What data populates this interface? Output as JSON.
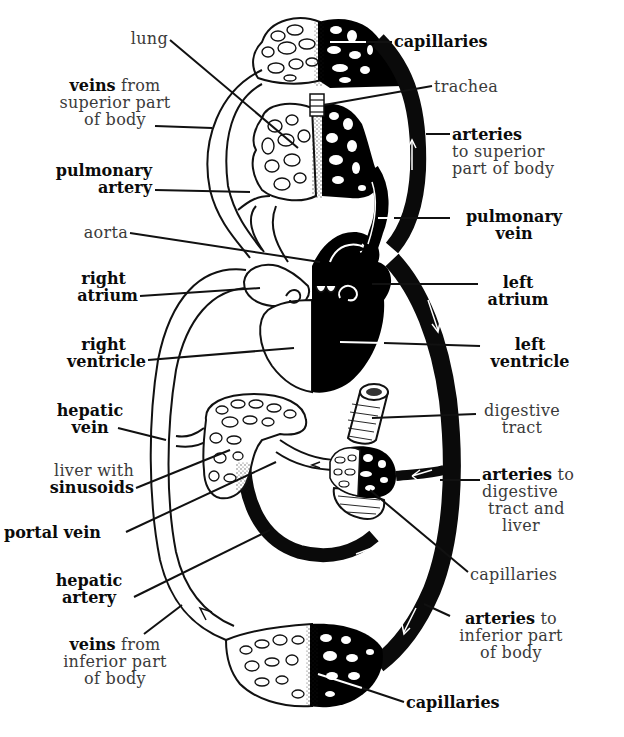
{
  "diagram": {
    "labels": {
      "lung": {
        "line1": "lung"
      },
      "capillaries_top": {
        "line1": "capillaries"
      },
      "trachea": {
        "line1": "trachea"
      },
      "veins_superior": {
        "bold": "veins",
        "rest": " from",
        "line2": "superior part",
        "line3": "of body"
      },
      "arteries_superior": {
        "bold": "arteries",
        "line2": "to superior",
        "line3": "part of body"
      },
      "pulmonary_artery": {
        "line1": "pulmonary",
        "line2": "artery"
      },
      "pulmonary_vein": {
        "line1": "pulmonary",
        "line2": "vein"
      },
      "aorta": {
        "line1": "aorta"
      },
      "right_atrium": {
        "line1": "right",
        "line2": "atrium"
      },
      "left_atrium": {
        "line1": "left",
        "line2": "atrium"
      },
      "right_ventricle": {
        "line1": "right",
        "line2": "ventricle"
      },
      "left_ventricle": {
        "line1": "left",
        "line2": "ventricle"
      },
      "hepatic_vein": {
        "line1": "hepatic",
        "line2": "vein"
      },
      "digestive_tract": {
        "line1": "digestive",
        "line2": "tract"
      },
      "liver": {
        "line1": "liver with",
        "line2": "sinusoids"
      },
      "arteries_digestive": {
        "bold": "arteries",
        "rest": " to",
        "line2": "digestive",
        "line3": "tract and",
        "line4": "liver"
      },
      "portal_vein": {
        "line1": "portal vein"
      },
      "capillaries_mid": {
        "line1": "capillaries"
      },
      "hepatic_artery": {
        "line1": "hepatic",
        "line2": "artery"
      },
      "arteries_inferior": {
        "bold": "arteries",
        "rest": " to",
        "line2": "inferior part",
        "line3": "of body"
      },
      "veins_inferior": {
        "bold": "veins",
        "rest": " from",
        "line2": "inferior part",
        "line3": "of body"
      },
      "capillaries_bottom": {
        "line1": "capillaries"
      }
    },
    "colors": {
      "oxygenated": "#000000",
      "deoxygenated": "#ffffff",
      "outline": "#111111"
    }
  }
}
